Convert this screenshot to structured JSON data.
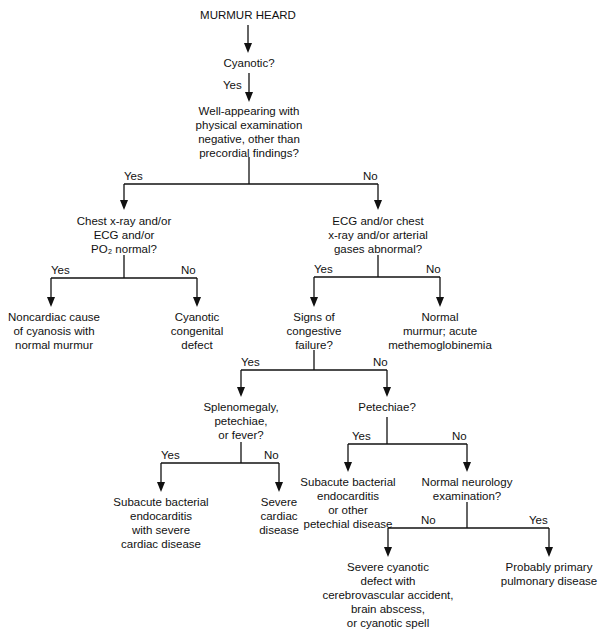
{
  "diagram": {
    "title": "MURMUR HEARD",
    "nodes": {
      "cyanotic": "Cyanotic?",
      "well_appearing": [
        "Well-appearing with",
        "physical examination",
        "negative, other than",
        "precordial findings?"
      ],
      "chest_xray_normal": [
        "Chest x-ray and/or",
        "ECG and/or",
        "PO₂ normal?"
      ],
      "ecg_abnormal": [
        "ECG and/or chest",
        "x-ray and/or arterial",
        "gases abnormal?"
      ],
      "noncardiac": [
        "Noncardiac cause",
        "of cyanosis with",
        "normal murmur"
      ],
      "cyanotic_congenital": [
        "Cyanotic",
        "congenital",
        "defect"
      ],
      "signs_chf": [
        "Signs of",
        "congestive",
        "failure?"
      ],
      "normal_murmur": [
        "Normal",
        "murmur; acute",
        "methemoglobinemia"
      ],
      "splenomegaly": [
        "Splenomegaly,",
        "petechiae,",
        "or fever?"
      ],
      "petechiae": "Petechiae?",
      "sbe_severe": [
        "Subacute bacterial",
        "endocarditis",
        "with severe",
        "cardiac disease"
      ],
      "severe_cardiac": [
        "Severe",
        "cardiac",
        "disease"
      ],
      "sbe_other": [
        "Subacute bacterial",
        "endocarditis",
        "or other",
        "petechial disease"
      ],
      "neuro_exam": [
        "Normal neurology",
        "examination?"
      ],
      "severe_cyanotic": [
        "Severe cyanotic",
        "defect with",
        "cerebrovascular accident,",
        "brain abscess,",
        "or cyanotic spell"
      ],
      "pulmonary": [
        "Probably primary",
        "pulmonary disease"
      ]
    },
    "edge_labels": {
      "yes": "Yes",
      "no": "No"
    }
  }
}
